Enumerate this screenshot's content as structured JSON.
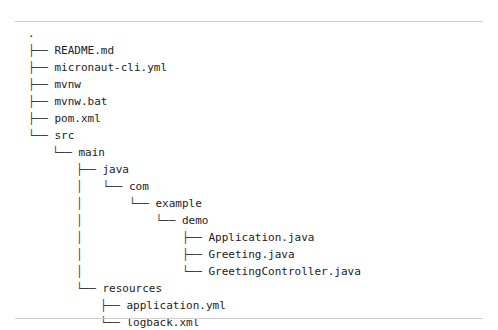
{
  "document": {
    "kind": "directory-tree-listing",
    "background_color": "#ffffff",
    "text_color": "#222222",
    "rule_color": "#cfcfcf",
    "font_size_px": 11,
    "line_height_px": 17,
    "indent_px": 24
  },
  "rules": {
    "top_label": "top-divider",
    "bottom_label": "bottom-divider"
  },
  "tree": {
    "root": ".",
    "lines": [
      {
        "indent": 0,
        "prefix": "",
        "label": "."
      },
      {
        "indent": 0,
        "prefix": "├── ",
        "label": "README.md"
      },
      {
        "indent": 0,
        "prefix": "├── ",
        "label": "micronaut-cli.yml"
      },
      {
        "indent": 0,
        "prefix": "├── ",
        "label": "mvnw"
      },
      {
        "indent": 0,
        "prefix": "├── ",
        "label": "mvnw.bat"
      },
      {
        "indent": 0,
        "prefix": "├── ",
        "label": "pom.xml"
      },
      {
        "indent": 0,
        "prefix": "└── ",
        "label": "src"
      },
      {
        "indent": 1,
        "prefix": "└── ",
        "label": "main"
      },
      {
        "indent": 2,
        "prefix": "├── ",
        "label": "java"
      },
      {
        "indent": 2,
        "prefix": "│   └── ",
        "label": "com"
      },
      {
        "indent": 2,
        "prefix": "│       └── ",
        "label": "example"
      },
      {
        "indent": 2,
        "prefix": "│           └── ",
        "label": "demo"
      },
      {
        "indent": 2,
        "prefix": "│               ├── ",
        "label": "Application.java"
      },
      {
        "indent": 2,
        "prefix": "│               ├── ",
        "label": "Greeting.java"
      },
      {
        "indent": 2,
        "prefix": "│               └── ",
        "label": "GreetingController.java"
      },
      {
        "indent": 2,
        "prefix": "└── ",
        "label": "resources"
      },
      {
        "indent": 3,
        "prefix": "├── ",
        "label": "application.yml"
      },
      {
        "indent": 3,
        "prefix": "└── ",
        "label": "logback.xml"
      }
    ]
  }
}
